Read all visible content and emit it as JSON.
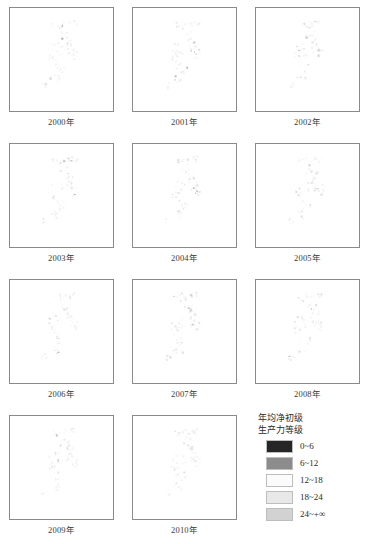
{
  "figure": {
    "type": "small-multiples-choropleth-map-series",
    "panel_count": 11,
    "columns": 3,
    "rows": 4
  },
  "panels": [
    {
      "year_label": "2000年",
      "year": 2000
    },
    {
      "year_label": "2001年",
      "year": 2001
    },
    {
      "year_label": "2002年",
      "year": 2002
    },
    {
      "year_label": "2003年",
      "year": 2003
    },
    {
      "year_label": "2004年",
      "year": 2004
    },
    {
      "year_label": "2005年",
      "year": 2005
    },
    {
      "year_label": "2006年",
      "year": 2006
    },
    {
      "year_label": "2007年",
      "year": 2007
    },
    {
      "year_label": "2008年",
      "year": 2008
    },
    {
      "year_label": "2009年",
      "year": 2009
    },
    {
      "year_label": "2010年",
      "year": 2010
    }
  ],
  "legend": {
    "title_line1": "年均净初级",
    "title_line2": "生产力等级",
    "classes": [
      {
        "label": "0~6",
        "color": "#262626"
      },
      {
        "label": "6~12",
        "color": "#8c8c8c"
      },
      {
        "label": "12~18",
        "color": "#fbfbfb"
      },
      {
        "label": "18~24",
        "color": "#e8e8e8"
      },
      {
        "label": "24~+∞",
        "color": "#d2d2d2"
      }
    ]
  },
  "chart_data": {
    "type": "heatmap",
    "subtitle": "",
    "xlabel": "",
    "ylabel": "",
    "grid": false,
    "legend_position": "bottom-right",
    "categories": [
      "0~6",
      "6~12",
      "12~18",
      "18~24",
      "24~+∞"
    ],
    "class_colors": [
      "#262626",
      "#8c8c8c",
      "#fbfbfb",
      "#e8e8e8",
      "#d2d2d2"
    ],
    "series": [
      {
        "name": "2000年",
        "values": [
          1,
          2,
          3,
          4,
          5
        ]
      },
      {
        "name": "2001年",
        "values": [
          1,
          2,
          3,
          4,
          5
        ]
      },
      {
        "name": "2002年",
        "values": [
          1,
          2,
          3,
          4,
          5
        ]
      },
      {
        "name": "2003年",
        "values": [
          1,
          2,
          3,
          4,
          5
        ]
      },
      {
        "name": "2004年",
        "values": [
          1,
          2,
          3,
          4,
          5
        ]
      },
      {
        "name": "2005年",
        "values": [
          1,
          2,
          3,
          4,
          5
        ]
      },
      {
        "name": "2006年",
        "values": [
          1,
          2,
          3,
          4,
          5
        ]
      },
      {
        "name": "2007年",
        "values": [
          1,
          2,
          3,
          4,
          5
        ]
      },
      {
        "name": "2008年",
        "values": [
          1,
          2,
          3,
          4,
          5
        ]
      },
      {
        "name": "2009年",
        "values": [
          1,
          2,
          3,
          4,
          5
        ]
      },
      {
        "name": "2010年",
        "values": [
          1,
          2,
          3,
          4,
          5
        ]
      }
    ]
  }
}
